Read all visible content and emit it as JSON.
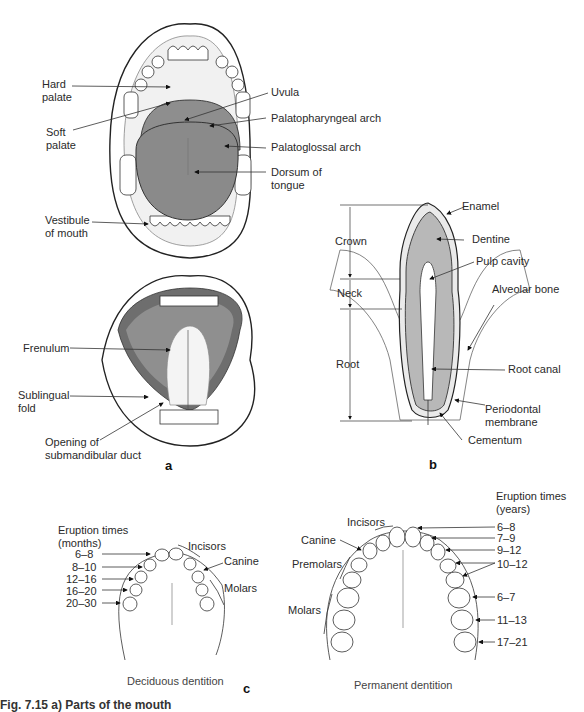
{
  "panel_a": {
    "letter": "a",
    "open_mouth_labels": {
      "hard_palate": "Hard\npalate",
      "soft_palate": "Soft\npalate",
      "uvula": "Uvula",
      "palatopharyngeal_arch": "Palatopharyngeal arch",
      "palatoglossal_arch": "Palatoglossal arch",
      "dorsum_of_tongue": "Dorsum of\ntongue",
      "vestibule_of_mouth": "Vestibule\nof mouth"
    },
    "under_tongue_labels": {
      "frenulum": "Frenulum",
      "sublingual_fold": "Sublingual\nfold",
      "opening_of_submandibular_duct": "Opening of\nsubmandibular duct"
    }
  },
  "panel_b": {
    "letter": "b",
    "regions": {
      "crown": "Crown",
      "neck": "Neck",
      "root": "Root"
    },
    "labels": {
      "enamel": "Enamel",
      "dentine": "Dentine",
      "pulp_cavity": "Pulp cavity",
      "alveolar_bone": "Alveolar bone",
      "root_canal": "Root canal",
      "periodontal_membrane": "Periodontal\nmembrane",
      "cementum": "Cementum"
    }
  },
  "panel_c": {
    "letter": "c",
    "deciduous": {
      "caption": "Deciduous dentition",
      "eruption_header": "Eruption times\n(months)",
      "eruption_times": [
        "6–8",
        "8–10",
        "12–16",
        "16–20",
        "20–30"
      ],
      "groups": {
        "incisors": "Incisors",
        "canine": "Canine",
        "molars": "Molars"
      }
    },
    "permanent": {
      "caption": "Permanent dentition",
      "eruption_header": "Eruption times\n(years)",
      "eruption_times": [
        "6–8",
        "7–9",
        "9–12",
        "10–12",
        "6–7",
        "11–13",
        "17–21"
      ],
      "groups": {
        "incisors": "Incisors",
        "canine": "Canine",
        "premolars": "Premolars",
        "molars": "Molars"
      }
    }
  },
  "figure_caption": "Fig. 7.15   a) Parts of the mouth"
}
